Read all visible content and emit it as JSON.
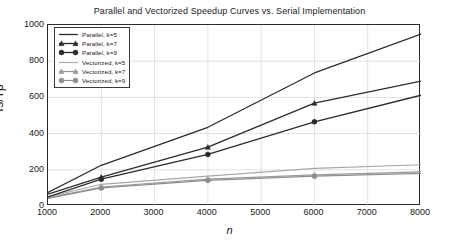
{
  "chart_data": {
    "type": "line",
    "title": "Parallel and Vectorized Speedup Curves vs. Serial Implementation",
    "xlabel": "n",
    "ylabel": "Ts/Tp",
    "xlim": [
      1000,
      8000
    ],
    "ylim": [
      0,
      1000
    ],
    "xticks": [
      1000,
      2000,
      3000,
      4000,
      5000,
      6000,
      7000,
      8000
    ],
    "yticks": [
      0,
      200,
      400,
      600,
      800,
      1000
    ],
    "grid": true,
    "legend_position": "upper left",
    "x": [
      1000,
      2000,
      4000,
      6000,
      8000
    ],
    "series": [
      {
        "name": "Parallel, k=5",
        "values": [
          75,
          225,
          435,
          735,
          950
        ],
        "color": "#2b2b2b",
        "marker": "none",
        "width": 1.3
      },
      {
        "name": "Parallel, k=7",
        "values": [
          65,
          160,
          325,
          568,
          690
        ],
        "color": "#2b2b2b",
        "marker": "triangle",
        "width": 1.3
      },
      {
        "name": "Parallel, k=9",
        "values": [
          50,
          148,
          285,
          465,
          612
        ],
        "color": "#2b2b2b",
        "marker": "circle",
        "width": 1.3
      },
      {
        "name": "Vectorized, k=5",
        "values": [
          50,
          120,
          165,
          208,
          228
        ],
        "color": "#a8a8a8",
        "marker": "none",
        "width": 1.2
      },
      {
        "name": "Vectorized, k=7",
        "values": [
          45,
          105,
          148,
          172,
          188
        ],
        "color": "#9a9a9a",
        "marker": "triangle",
        "width": 1.2
      },
      {
        "name": "Vectorized, k=9",
        "values": [
          42,
          100,
          142,
          165,
          180
        ],
        "color": "#8e8e8e",
        "marker": "circle",
        "width": 1.2
      }
    ]
  },
  "axes": {
    "ytick_labels": [
      "0",
      "200",
      "400",
      "600",
      "800",
      "1000"
    ],
    "xtick_labels": [
      "1000",
      "2000",
      "3000",
      "4000",
      "5000",
      "6000",
      "7000",
      "8000"
    ]
  },
  "style": {
    "grid_color": "#d4d4d4",
    "axis_color": "#2a2a2a",
    "text_color": "#1a1a1a",
    "background": "#ffffff"
  }
}
